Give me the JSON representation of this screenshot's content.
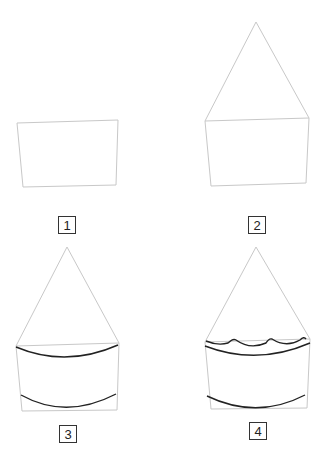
{
  "steps": [
    {
      "number": "1",
      "description": "Draw a slightly tapered rectangle"
    },
    {
      "number": "2",
      "description": "Add a tall triangle on top of the rectangle"
    },
    {
      "number": "3",
      "description": "Add curved lines at the top and bottom of the base"
    },
    {
      "number": "4",
      "description": "Add a scalloped wavy edge above the top curve"
    }
  ],
  "colors": {
    "guide_line": "#c8c8c8",
    "ink_line": "#222222",
    "label_border": "#333333"
  }
}
